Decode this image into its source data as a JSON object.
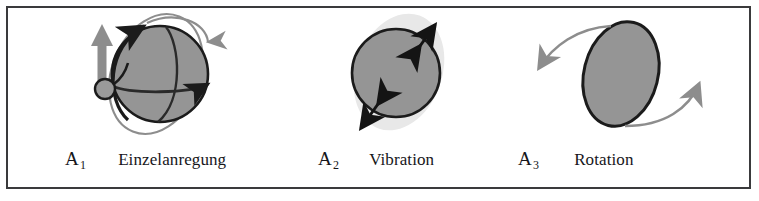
{
  "figure": {
    "kind": "schematic-diagram",
    "border_color": "#3a3a3c",
    "background_color": "#ffffff"
  },
  "colors": {
    "sphere_fill": "#959595",
    "sphere_outline": "#1b1b1b",
    "halo_fill": "#e8e8e8",
    "accent_gray": "#8d8d8d",
    "accent_dark": "#1b1b1b",
    "text": "#16161a"
  },
  "panels": [
    {
      "id": "einzelanregung",
      "tag": "A",
      "tag_subscript": "1",
      "label": "Einzelanregung",
      "elements": [
        "gray-sphere",
        "orbit-ellipse",
        "equator-arrow",
        "meridian-arrow",
        "impulse-up-arrow",
        "impulse-ball",
        "return-down-arrow"
      ]
    },
    {
      "id": "vibration",
      "tag": "A",
      "tag_subscript": "2",
      "label": "Vibration",
      "elements": [
        "gray-sphere",
        "vibration-halo",
        "double-arrow-top-right",
        "double-arrow-bottom-left"
      ]
    },
    {
      "id": "rotation",
      "tag": "A",
      "tag_subscript": "3",
      "label": "Rotation",
      "elements": [
        "gray-ellipse",
        "rotation-arrow-left",
        "rotation-arrow-right"
      ]
    }
  ]
}
